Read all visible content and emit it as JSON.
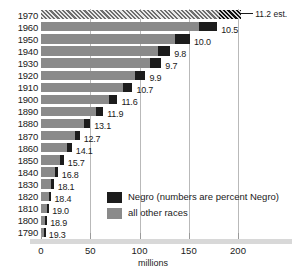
{
  "chart_data": {
    "type": "bar",
    "orientation": "horizontal",
    "title": "",
    "xlabel": "millions",
    "ylabel": "",
    "xlim": [
      0,
      250
    ],
    "xticks": [
      0,
      50,
      100,
      150,
      200
    ],
    "xtick_labels": [
      "0",
      "50",
      "100",
      "150",
      "200"
    ],
    "grid": true,
    "legend_position": "inside-lower-center",
    "categories": [
      "1970",
      "1960",
      "1950",
      "1940",
      "1930",
      "1920",
      "1910",
      "1900",
      "1890",
      "1880",
      "1870",
      "1860",
      "1850",
      "1840",
      "1830",
      "1820",
      "1810",
      "1800",
      "1790"
    ],
    "series": [
      {
        "name": "all other races",
        "color": "#8a8a8a",
        "values": [
          180.4,
          160.0,
          136.3,
          118.3,
          110.3,
          95.5,
          83.0,
          68.8,
          55.6,
          43.4,
          34.3,
          26.9,
          19.6,
          14.2,
          10.6,
          7.9,
          5.9,
          4.3,
          3.2
        ]
      },
      {
        "name": "Negro",
        "color": "#1c1c1c",
        "values": [
          22.7,
          18.9,
          15.0,
          12.9,
          11.9,
          10.5,
          9.8,
          8.8,
          7.5,
          6.6,
          5.0,
          4.4,
          3.6,
          2.9,
          2.3,
          1.8,
          1.4,
          1.0,
          0.8
        ]
      }
    ],
    "totals": [
      203.2,
      179.0,
      151.3,
      131.2,
      122.2,
      106.0,
      92.8,
      77.6,
      63.1,
      50.0,
      39.3,
      31.3,
      23.2,
      17.1,
      12.9,
      9.7,
      7.3,
      5.3,
      3.9
    ],
    "point_labels": [
      "11.2",
      "10.5",
      "10.0",
      "9.8",
      "9.7",
      "9.9",
      "10.7",
      "11.6",
      "11.9",
      "13.1",
      "12.7",
      "14.1",
      "15.7",
      "16.8",
      "18.1",
      "18.4",
      "19.0",
      "18.9",
      "19.3"
    ],
    "estimate_row": "1970",
    "estimate_note": "11.2 est.",
    "annotation": "numbers are percent Negro"
  },
  "legend": {
    "items": [
      {
        "label": "Negro (numbers are percent Negro)",
        "color": "#1c1c1c"
      },
      {
        "label": "all other races",
        "color": "#8a8a8a"
      }
    ]
  }
}
